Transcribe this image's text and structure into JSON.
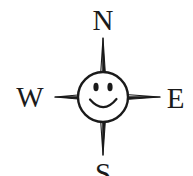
{
  "figure": {
    "name": "compass-rose-smiley",
    "background_color": "#ffffff",
    "ink_color": "#1a1a1a",
    "width": 193,
    "height": 176
  },
  "labels": {
    "north": "N",
    "west": "W",
    "east": "E",
    "south": "S"
  },
  "compass": {
    "center_x": 103,
    "center_y": 97,
    "face_radius": 25,
    "points": [
      {
        "name": "north",
        "tip_x": 103,
        "tip_y": 38
      },
      {
        "name": "east",
        "tip_x": 160,
        "tip_y": 97
      },
      {
        "name": "south",
        "tip_x": 103,
        "tip_y": 155
      },
      {
        "name": "west",
        "tip_x": 55,
        "tip_y": 97
      }
    ],
    "face": {
      "left_eye": {
        "cx": 96,
        "cy": 87,
        "rx": 2.6,
        "ry": 4.2
      },
      "right_eye": {
        "cx": 110,
        "cy": 87,
        "rx": 2.6,
        "ry": 4.2
      },
      "smile": {
        "start_x": 90,
        "end_x": 117,
        "y": 100,
        "depth": 11
      }
    }
  }
}
